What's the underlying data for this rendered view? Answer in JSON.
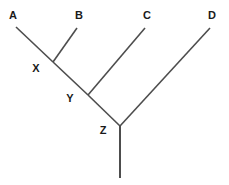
{
  "figure": {
    "kind": "phylogenetic-tree",
    "background_color": "#ffffff",
    "line_color": "#4d4d4d",
    "label_color": "#1a1a1a",
    "width": 229,
    "height": 185
  },
  "tip_labels": [
    {
      "id": "A",
      "text": "A",
      "x": 13,
      "y": 15
    },
    {
      "id": "B",
      "text": "B",
      "x": 79,
      "y": 15
    },
    {
      "id": "C",
      "text": "C",
      "x": 147,
      "y": 15
    },
    {
      "id": "D",
      "text": "D",
      "x": 212,
      "y": 15
    }
  ],
  "node_labels": [
    {
      "id": "X",
      "text": "X",
      "x": 36,
      "y": 68
    },
    {
      "id": "Y",
      "text": "Y",
      "x": 70,
      "y": 98
    },
    {
      "id": "Z",
      "text": "Z",
      "x": 103,
      "y": 130
    }
  ],
  "nodes": {
    "X": {
      "x": 53,
      "y": 62
    },
    "Y": {
      "x": 88,
      "y": 95
    },
    "Z": {
      "x": 120,
      "y": 126
    }
  },
  "tips": {
    "A": {
      "x": 16,
      "y": 27
    },
    "B": {
      "x": 77,
      "y": 28
    },
    "C": {
      "x": 145,
      "y": 28
    },
    "D": {
      "x": 210,
      "y": 28
    }
  },
  "root": {
    "x": 120,
    "y_top": 126,
    "y_bottom": 178
  },
  "branches": [
    {
      "id": "branch-x-a",
      "from": "X",
      "to": "A",
      "x1": 53,
      "y1": 62,
      "x2": 16,
      "y2": 27
    },
    {
      "id": "branch-x-b",
      "from": "X",
      "to": "B",
      "x1": 53,
      "y1": 62,
      "x2": 77,
      "y2": 28
    },
    {
      "id": "branch-y-x",
      "from": "Y",
      "to": "X",
      "x1": 88,
      "y1": 95,
      "x2": 53,
      "y2": 62
    },
    {
      "id": "branch-y-c",
      "from": "Y",
      "to": "C",
      "x1": 88,
      "y1": 95,
      "x2": 145,
      "y2": 28
    },
    {
      "id": "branch-z-y",
      "from": "Z",
      "to": "Y",
      "x1": 120,
      "y1": 126,
      "x2": 88,
      "y2": 95
    },
    {
      "id": "branch-z-d",
      "from": "Z",
      "to": "D",
      "x1": 120,
      "y1": 126,
      "x2": 210,
      "y2": 28
    },
    {
      "id": "branch-root",
      "from": "Z",
      "to": "root",
      "x1": 120,
      "y1": 126,
      "x2": 120,
      "y2": 178
    }
  ]
}
